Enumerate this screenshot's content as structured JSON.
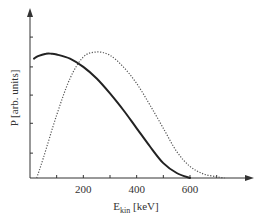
{
  "chart_data": {
    "type": "line",
    "title": "",
    "xlabel": "E_kin [keV]",
    "xlabel_main": "E",
    "xlabel_sub": "kin",
    "xlabel_unit": " [keV]",
    "ylabel": "P [arb. units]",
    "xlim": [
      0,
      800
    ],
    "ylim": [
      0,
      1.0
    ],
    "grid": false,
    "legend": null,
    "x_ticks": [
      100,
      200,
      300,
      400,
      500,
      600,
      700
    ],
    "x_tick_labels": [
      {
        "value": 200,
        "label": "200"
      },
      {
        "value": 400,
        "label": "400"
      },
      {
        "value": 600,
        "label": "600"
      }
    ],
    "y_ticks": [
      0.15,
      0.33,
      0.5,
      0.67,
      0.85
    ],
    "y_tick_labels": [],
    "series": [
      {
        "name": "solid",
        "style": "solid",
        "x": [
          15,
          30,
          60,
          80,
          100,
          150,
          200,
          250,
          300,
          350,
          400,
          450,
          500,
          550,
          600
        ],
        "y": [
          0.72,
          0.735,
          0.75,
          0.75,
          0.745,
          0.72,
          0.67,
          0.6,
          0.51,
          0.41,
          0.3,
          0.19,
          0.09,
          0.03,
          0.0
        ]
      },
      {
        "name": "dotted",
        "style": "dotted",
        "x": [
          25,
          50,
          100,
          150,
          200,
          250,
          300,
          350,
          400,
          450,
          500,
          550,
          600,
          650,
          700,
          730
        ],
        "y": [
          0.0,
          0.12,
          0.38,
          0.6,
          0.73,
          0.76,
          0.74,
          0.67,
          0.57,
          0.44,
          0.3,
          0.16,
          0.07,
          0.025,
          0.007,
          0.0
        ]
      }
    ]
  }
}
